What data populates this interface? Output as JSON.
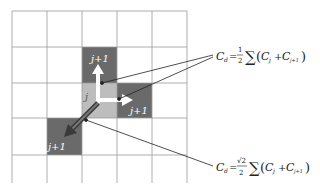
{
  "diagram": {
    "grid": {
      "cols": 5,
      "rows": 5
    },
    "cells": [
      {
        "role": "neighbor-up",
        "label": "j+1",
        "shade": "#6a6a6a",
        "col": 2,
        "row": 1
      },
      {
        "role": "neighbor-right",
        "label": "j+1",
        "shade": "#6a6a6a",
        "col": 3,
        "row": 2
      },
      {
        "role": "center",
        "label": "j",
        "shade": "#bdbdbd",
        "col": 2,
        "row": 2
      },
      {
        "role": "neighbor-diagonal",
        "label": "j+1",
        "shade": "#6a6a6a",
        "col": 1,
        "row": 3
      }
    ],
    "formula_orthogonal": {
      "lhs": "C",
      "lhs_sub": "d",
      "eq": "=",
      "coef_num": "1",
      "coef_den": "2",
      "sum": "∑",
      "open": "(",
      "t1": "C",
      "t1_sub": "j",
      "plus": "+",
      "t2": "C",
      "t2_sub": "j+1",
      "close": ")"
    },
    "formula_diagonal": {
      "lhs": "C",
      "lhs_sub": "d",
      "eq": "=",
      "coef_num": "√2",
      "coef_den": "2",
      "sum": "∑",
      "open": "(",
      "t1": "C",
      "t1_sub": "j",
      "plus": "+",
      "t2": "C",
      "t2_sub": "j+1",
      "close": ")"
    }
  }
}
